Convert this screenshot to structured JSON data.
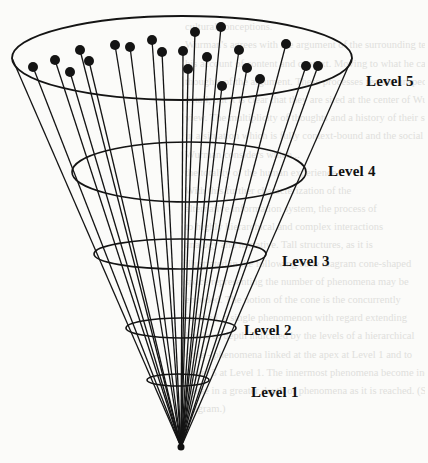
{
  "figure": {
    "type": "cone-diagram",
    "levels": [
      {
        "label": "Level 5",
        "x": 366,
        "y": 73
      },
      {
        "label": "Level 4",
        "x": 328,
        "y": 163
      },
      {
        "label": "Level 3",
        "x": 282,
        "y": 253
      },
      {
        "label": "Level 2",
        "x": 244,
        "y": 322
      },
      {
        "label": "Level 1",
        "x": 251,
        "y": 384
      }
    ],
    "apex": {
      "x": 181,
      "y": 447
    },
    "ellipses": [
      {
        "level": 5,
        "cx": 182,
        "cy": 58,
        "rx": 170,
        "ry": 42
      },
      {
        "level": 4,
        "cx": 189,
        "cy": 172,
        "rx": 117,
        "ry": 30
      },
      {
        "level": 3,
        "cx": 180,
        "cy": 254,
        "rx": 86,
        "ry": 15
      },
      {
        "level": 2,
        "cx": 181,
        "cy": 328,
        "rx": 55,
        "ry": 10
      },
      {
        "level": 1,
        "cx": 178,
        "cy": 380,
        "rx": 31,
        "ry": 6
      }
    ],
    "points": [
      [
        33,
        67
      ],
      [
        55,
        60
      ],
      [
        70,
        72
      ],
      [
        80,
        50
      ],
      [
        89,
        61
      ],
      [
        115,
        45
      ],
      [
        130,
        47
      ],
      [
        152,
        40
      ],
      [
        162,
        52
      ],
      [
        183,
        51
      ],
      [
        188,
        69
      ],
      [
        195,
        32
      ],
      [
        207,
        57
      ],
      [
        221,
        27
      ],
      [
        222,
        86
      ],
      [
        239,
        50
      ],
      [
        247,
        68
      ],
      [
        260,
        79
      ],
      [
        286,
        44
      ],
      [
        306,
        66
      ],
      [
        318,
        66
      ]
    ],
    "outer_lines": [
      [
        12,
        58
      ],
      [
        352,
        58
      ]
    ]
  },
  "bleed_through_text": [
    "",
    "cultural conceptions.",
    "Wurman's agrees with the argument of the surrounding text in",
    "his account of content and context. Moving to what he calls the next",
    "thoughts of the argument. These processes remain unspecified in",
    "detail, but it is clear that they are sited at the center of Wurman's",
    "view. The multiplicity of thoughts and a history of their structure",
    "in a situation which is fully context-bound and the social circle",
    "Wurman considers which...",
    "the totality of the human experience.",
    "With this further characterization of the",
    "alternative information system, the process of",
    "to highly hierarchical and complex interactions",
    "analogy and narrative. Tall structures, as it is",
    "illustrated in the following cone diagram cone-shaped",
    "space representing the number of phenomena may be",
    "encoded. The notion of the cone is the concurrently",
    "isolated, a single phenomenon with regard extending",
    "levels of depth indicated by the levels of a hierarchical",
    "cone - phenomena linked at the apex at Level 1 and to",
    "Level 5 at Level 1. The innermost phenomena become increasingly",
    "dense in a greater depth of phenomena as it is reached. (See",
    "diagram.)"
  ]
}
